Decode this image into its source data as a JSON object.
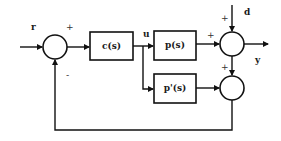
{
  "diagram": {
    "type": "control-block-diagram",
    "signals": {
      "reference": "r",
      "control": "u",
      "disturbance": "d",
      "output": "y"
    },
    "blocks": [
      {
        "id": "controller",
        "label": "c(s)"
      },
      {
        "id": "plant",
        "label": "p(s)"
      },
      {
        "id": "plant-model",
        "label": "p'(s)"
      }
    ],
    "summing_junctions": [
      {
        "id": "input-sum",
        "signs": {
          "reference": "+",
          "feedback": "-"
        }
      },
      {
        "id": "output-sum",
        "signs": {
          "plant": "+",
          "disturbance": "+"
        }
      },
      {
        "id": "model-sum",
        "signs": {
          "output": "+"
        }
      }
    ]
  }
}
